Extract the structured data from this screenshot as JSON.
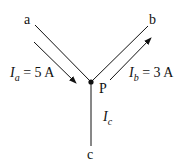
{
  "nodes": {
    "a": "a",
    "b": "b",
    "c": "c",
    "p": "P"
  },
  "currents": {
    "ia": {
      "symbol": "I",
      "sub": "a",
      "value": "= 5 A"
    },
    "ib": {
      "symbol": "I",
      "sub": "b",
      "value": "= 3 A"
    },
    "ic": {
      "symbol": "I",
      "sub": "c"
    }
  },
  "colors": {
    "line": "#111111",
    "background": "#ffffff"
  }
}
